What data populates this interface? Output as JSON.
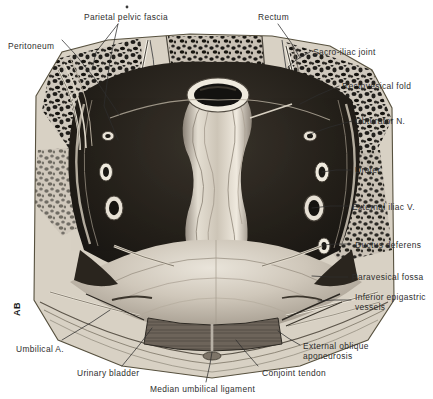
{
  "figure": {
    "signature": "AB",
    "background_color": "#ffffff",
    "ink_color": "#2e2e2e"
  },
  "labels": [
    {
      "id": "parietal-pelvic-fascia",
      "text": "Parietal pelvic fascia",
      "x": 84,
      "y": 13,
      "align": "left",
      "lines": 1
    },
    {
      "id": "rectum",
      "text": "Rectum",
      "x": 258,
      "y": 13,
      "align": "left",
      "lines": 1
    },
    {
      "id": "peritoneum",
      "text": "Peritoneum",
      "x": 8,
      "y": 42,
      "align": "left",
      "lines": 1
    },
    {
      "id": "sacro-iliac-joint",
      "text": "Sacro-iliac joint",
      "x": 313,
      "y": 48,
      "align": "left",
      "lines": 1
    },
    {
      "id": "rectovesical-fold",
      "text": "Rectovesical fold",
      "x": 342,
      "y": 82,
      "align": "left",
      "lines": 1
    },
    {
      "id": "obturator-n",
      "text": "Obturator N.",
      "x": 355,
      "y": 117,
      "align": "left",
      "lines": 1
    },
    {
      "id": "ureter",
      "text": "Ureter",
      "x": 355,
      "y": 166,
      "align": "left",
      "lines": 1
    },
    {
      "id": "external-iliac-v",
      "text": "External iliac V.",
      "x": 352,
      "y": 203,
      "align": "left",
      "lines": 1
    },
    {
      "id": "ductus-deferens",
      "text": "Ductus deferens",
      "x": 355,
      "y": 241,
      "align": "left",
      "lines": 1
    },
    {
      "id": "paravesical-fossa",
      "text": "Paravesical fossa",
      "x": 352,
      "y": 273,
      "align": "left",
      "lines": 1
    },
    {
      "id": "inferior-epigastric-vessels",
      "text": "Inferior epigastric\nvessels",
      "x": 355,
      "y": 293,
      "align": "left",
      "lines": 2
    },
    {
      "id": "external-oblique-aponeurosis",
      "text": "External oblique\naponeurosis",
      "x": 303,
      "y": 342,
      "align": "left",
      "lines": 2
    },
    {
      "id": "umbilical-a",
      "text": "Umbilical A.",
      "x": 16,
      "y": 345,
      "align": "left",
      "lines": 1
    },
    {
      "id": "urinary-bladder",
      "text": "Urinary bladder",
      "x": 77,
      "y": 369,
      "align": "left",
      "lines": 1
    },
    {
      "id": "conjoint-tendon",
      "text": "Conjoint tendon",
      "x": 262,
      "y": 369,
      "align": "left",
      "lines": 1
    },
    {
      "id": "median-umbilical-ligament",
      "text": "Median umbilical ligament",
      "x": 150,
      "y": 385,
      "align": "left",
      "lines": 1
    }
  ],
  "leader_lines": [
    {
      "id": "leader-parietal-pelvic-fascia",
      "points": "118,24 96,52 92,70"
    },
    {
      "id": "leader-parietal-pelvic-fascia-2",
      "points": "118,24 110,60 104,106 118,140"
    },
    {
      "id": "leader-rectum",
      "points": "278,24 292,44 300,58"
    },
    {
      "id": "leader-peritoneum",
      "points": "62,40 75,54 96,80 120,116"
    },
    {
      "id": "leader-sacro-iliac-joint",
      "points": "310,52 296,60 288,67"
    },
    {
      "id": "leader-rectovesical-fold",
      "points": "339,86 318,95 300,104"
    },
    {
      "id": "leader-obturator-n",
      "points": "352,121 330,127 310,134"
    },
    {
      "id": "leader-ureter",
      "points": "351,170 336,170 322,172"
    },
    {
      "id": "leader-external-iliac-v",
      "points": "348,206 330,206 312,208"
    },
    {
      "id": "leader-ductus-deferens",
      "points": "351,244 336,244 322,245"
    },
    {
      "id": "leader-paravesical-fossa",
      "points": "348,277 330,277 312,276"
    },
    {
      "id": "leader-inferior-epigastric",
      "points": "351,300 334,300 318,301"
    },
    {
      "id": "leader-external-oblique",
      "points": "300,345 288,338 278,331"
    },
    {
      "id": "leader-umbilical-a",
      "points": "62,340 92,322 110,310"
    },
    {
      "id": "leader-urinary-bladder",
      "points": "122,366 140,344 152,328"
    },
    {
      "id": "leader-conjoint-tendon",
      "points": "258,366 244,350 236,340"
    },
    {
      "id": "leader-median-umbilical",
      "points": "206,382 210,364 212,352"
    }
  ],
  "anatomy": {
    "structures": [
      "rectum",
      "urinary bladder",
      "sacrum",
      "iliac bone",
      "external oblique aponeurosis",
      "rectus abdominis",
      "peritoneum",
      "parietal pelvic fascia"
    ]
  }
}
